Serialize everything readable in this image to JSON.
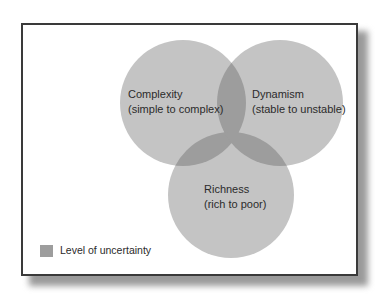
{
  "diagram": {
    "type": "venn",
    "circles": [
      {
        "id": "complexity",
        "title": "Complexity",
        "subtitle": "(simple to complex)"
      },
      {
        "id": "dynamism",
        "title": "Dynamism",
        "subtitle": "(stable to unstable)"
      },
      {
        "id": "richness",
        "title": "Richness",
        "subtitle": "(rich to poor)"
      }
    ],
    "legend": {
      "label": "Level of uncertainty"
    },
    "colors": {
      "circle": "#c4c4c4",
      "overlap": "#9d9d9d",
      "swatch": "#9d9d9d",
      "border": "#3a3a3a"
    }
  }
}
